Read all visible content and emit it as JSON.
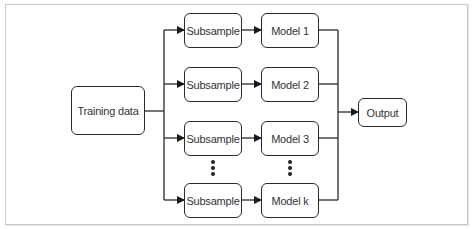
{
  "diagram": {
    "type": "flow",
    "title": "",
    "input": {
      "label": "Training data"
    },
    "branches": [
      {
        "subsample_label": "Subsample",
        "model_label": "Model 1"
      },
      {
        "subsample_label": "Subsample",
        "model_label": "Model 2"
      },
      {
        "subsample_label": "Subsample",
        "model_label": "Model 3"
      },
      {
        "subsample_label": "Subsample",
        "model_label": "Model k"
      }
    ],
    "ellipsis": "⋮",
    "output": {
      "label": "Output"
    },
    "colors": {
      "stroke": "#2a2a2a",
      "text": "#333333",
      "frame": "#c8c8c8",
      "background": "#ffffff"
    }
  }
}
